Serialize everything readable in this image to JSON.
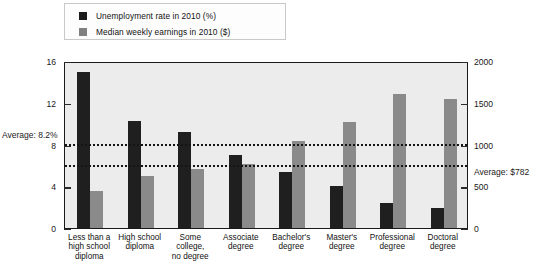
{
  "legend": {
    "items": [
      {
        "label": "Unemployment rate in 2010 (%)",
        "color": "#1c1c1c",
        "icon": "legend-swatch-black"
      },
      {
        "label": "Median weekly earnings in 2010 ($)",
        "color": "#808080",
        "icon": "legend-swatch-gray"
      }
    ]
  },
  "annotations": {
    "avg_unemployment_label": "Average: 8.2%",
    "avg_unemployment_value": 8.2,
    "avg_earnings_label": "Average: $782",
    "avg_earnings_value": 782
  },
  "axis_left": {
    "ticks": [
      "0",
      "4",
      "8",
      "12",
      "16"
    ],
    "values": [
      0,
      4,
      8,
      12,
      16
    ],
    "min": 0,
    "max": 16
  },
  "axis_right": {
    "ticks": [
      "0",
      "500",
      "1000",
      "1500",
      "2000"
    ],
    "values": [
      0,
      500,
      1000,
      1500,
      2000
    ],
    "min": 0,
    "max": 2000
  },
  "categories": [
    "Less than a\nhigh school\ndiploma",
    "High school\ndiploma",
    "Some\ncollege,\nno degree",
    "Associate\ndegree",
    "Bachelor's\ndegree",
    "Master's\ndegree",
    "Professional\ndegree",
    "Doctoral\ndegree"
  ],
  "chart_data": {
    "type": "bar",
    "title": "",
    "subtitle": "",
    "xlabel": "",
    "ylabel": "Unemployment rate in 2010 (%)",
    "y2label": "Median weekly earnings in 2010 ($)",
    "ylim": [
      0,
      16
    ],
    "y2lim": [
      0,
      2000
    ],
    "grid": false,
    "legend_position": "top-left",
    "categories": [
      "Less than a high school diploma",
      "High school diploma",
      "Some college, no degree",
      "Associate degree",
      "Bachelor's degree",
      "Master's degree",
      "Professional degree",
      "Doctoral degree"
    ],
    "series": [
      {
        "name": "Unemployment rate in 2010 (%)",
        "axis": "left",
        "color": "#1f1f1f",
        "values": [
          14.9,
          10.3,
          9.2,
          7.0,
          5.4,
          4.0,
          2.4,
          1.9
        ]
      },
      {
        "name": "Median weekly earnings in 2010 ($)",
        "axis": "right",
        "color": "#8a8a8a",
        "values": [
          444,
          626,
          712,
          767,
          1038,
          1272,
          1610,
          1550
        ]
      }
    ],
    "reference_lines": [
      {
        "label": "Average: 8.2%",
        "value": 8.2,
        "axis": "left",
        "style": "dotted"
      },
      {
        "label": "Average: $782",
        "value": 782,
        "axis": "right",
        "style": "dotted"
      }
    ]
  }
}
